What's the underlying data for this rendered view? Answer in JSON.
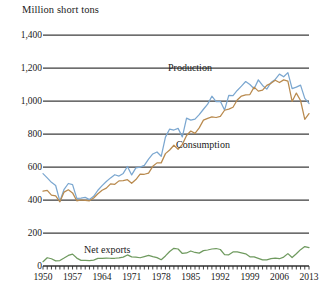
{
  "chart_data": {
    "type": "line",
    "title": "",
    "ylabel": "Million short tons",
    "xlabel": "",
    "ylim": [
      0,
      1400
    ],
    "xlim": [
      1950,
      2013
    ],
    "yticks": [
      "0",
      "200",
      "400",
      "600",
      "800",
      "1,000",
      "1,200",
      "1,400"
    ],
    "ytick_values": [
      0,
      200,
      400,
      600,
      800,
      1000,
      1200,
      1400
    ],
    "xticks": [
      "1950",
      "1957",
      "1964",
      "1971",
      "1978",
      "1985",
      "1992",
      "1999",
      "2006",
      "2013"
    ],
    "xtick_values": [
      1950,
      1957,
      1964,
      1971,
      1978,
      1985,
      1992,
      1999,
      2006,
      2013
    ],
    "grid": true,
    "legend": "inline-labels",
    "x": [
      1950,
      1951,
      1952,
      1953,
      1954,
      1955,
      1956,
      1957,
      1958,
      1959,
      1960,
      1961,
      1962,
      1963,
      1964,
      1965,
      1966,
      1967,
      1968,
      1969,
      1970,
      1971,
      1972,
      1973,
      1974,
      1975,
      1976,
      1977,
      1978,
      1979,
      1980,
      1981,
      1982,
      1983,
      1984,
      1985,
      1986,
      1987,
      1988,
      1989,
      1990,
      1991,
      1992,
      1993,
      1994,
      1995,
      1996,
      1997,
      1998,
      1999,
      2000,
      2001,
      2002,
      2003,
      2004,
      2005,
      2006,
      2007,
      2008,
      2009,
      2010,
      2011,
      2012,
      2013
    ],
    "series": [
      {
        "name": "Production",
        "color": "#7ba7d0",
        "values": [
          560,
          534,
          507,
          488,
          392,
          465,
          500,
          493,
          410,
          412,
          416,
          403,
          422,
          459,
          487,
          512,
          534,
          553,
          545,
          561,
          603,
          552,
          595,
          599,
          610,
          648,
          679,
          691,
          665,
          781,
          830,
          824,
          834,
          782,
          896,
          884,
          890,
          917,
          950,
          981,
          1029,
          996,
          998,
          945,
          1034,
          1033,
          1064,
          1090,
          1118,
          1100,
          1074,
          1128,
          1094,
          1072,
          1112,
          1131,
          1163,
          1147,
          1172,
          1075,
          1084,
          1096,
          1016,
          985
        ]
      },
      {
        "name": "Consumption",
        "color": "#b98a4e",
        "values": [
          454,
          458,
          430,
          425,
          389,
          448,
          462,
          443,
          395,
          400,
          398,
          395,
          412,
          438,
          459,
          472,
          498,
          495,
          516,
          518,
          523,
          501,
          524,
          557,
          556,
          563,
          604,
          625,
          625,
          681,
          703,
          732,
          707,
          737,
          791,
          818,
          804,
          837,
          884,
          895,
          904,
          900,
          907,
          944,
          951,
          962,
          1006,
          1030,
          1037,
          1039,
          1084,
          1060,
          1066,
          1095,
          1107,
          1126,
          1112,
          1128,
          1121,
          997,
          1048,
          1003,
          889,
          924
        ]
      },
      {
        "name": "Net exports",
        "color": "#6f9a5f",
        "values": [
          26,
          50,
          44,
          31,
          33,
          48,
          64,
          72,
          48,
          34,
          34,
          33,
          36,
          46,
          46,
          48,
          47,
          47,
          49,
          54,
          67,
          55,
          54,
          50,
          57,
          64,
          57,
          51,
          38,
          61,
          88,
          107,
          103,
          76,
          79,
          91,
          82,
          78,
          93,
          97,
          103,
          106,
          100,
          69,
          68,
          85,
          86,
          80,
          74,
          56,
          55,
          46,
          37,
          37,
          45,
          48,
          44,
          54,
          75,
          51,
          74,
          99,
          118,
          112
        ]
      }
    ]
  },
  "labels": {
    "production": "Production",
    "consumption": "Consumption",
    "net_exports": "Net exports"
  }
}
